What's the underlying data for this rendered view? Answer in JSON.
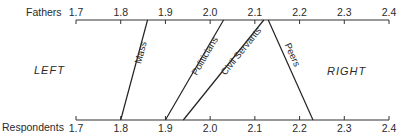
{
  "chart_data": {
    "type": "line",
    "subtype": "parallel-axis slope chart",
    "title": "",
    "axes": [
      {
        "name": "Fathers",
        "position": "top",
        "ticks": [
          "1.7",
          "1.8",
          "1.9",
          "2.0",
          "2.1",
          "2.2",
          "2.3",
          "2.4"
        ],
        "range": [
          1.7,
          2.4
        ]
      },
      {
        "name": "Respondents",
        "position": "bottom",
        "ticks": [
          "1.7",
          "1.8",
          "1.9",
          "2.0",
          "2.1",
          "2.2",
          "2.3",
          "2.4"
        ],
        "range": [
          1.7,
          2.4
        ]
      }
    ],
    "series": [
      {
        "name": "Mass",
        "fathers": 1.86,
        "respondents": 1.8
      },
      {
        "name": "Politicians",
        "fathers": 2.03,
        "respondents": 1.9
      },
      {
        "name": "Civil Servants",
        "fathers": 2.12,
        "respondents": 1.94
      },
      {
        "name": "Peers",
        "fathers": 2.13,
        "respondents": 2.23
      }
    ],
    "annotations": [
      "LEFT",
      "RIGHT"
    ],
    "grid": false,
    "legend": "inline labels along lines"
  },
  "labels": {
    "top_axis": "Fathers",
    "bottom_axis": "Respondents",
    "left": "LEFT",
    "right": "RIGHT"
  }
}
